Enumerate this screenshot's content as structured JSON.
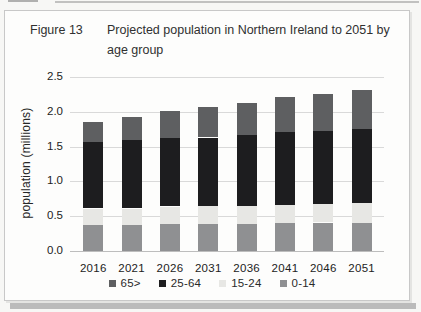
{
  "figure": {
    "label": "Figure 13",
    "title_line1": "Projected population in Northern Ireland to 2051 by",
    "title_line2": "age group"
  },
  "chart_data": {
    "type": "bar",
    "stacked": true,
    "title": "Figure 13  Projected population in Northern Ireland to 2051 by age group",
    "categories": [
      "2016",
      "2021",
      "2026",
      "2031",
      "2036",
      "2041",
      "2046",
      "2051"
    ],
    "series": [
      {
        "name": "0-14",
        "color": "#8f9092",
        "values": [
          0.37,
          0.38,
          0.39,
          0.39,
          0.39,
          0.4,
          0.41,
          0.41
        ]
      },
      {
        "name": "15-24",
        "color": "#e7e7e4",
        "values": [
          0.24,
          0.23,
          0.25,
          0.26,
          0.26,
          0.26,
          0.27,
          0.28
        ]
      },
      {
        "name": "25-64",
        "color": "#1d1d1f",
        "values": [
          0.95,
          0.98,
          0.98,
          0.98,
          1.02,
          1.05,
          1.05,
          1.06
        ]
      },
      {
        "name": "65>",
        "color": "#5e5f61",
        "values": [
          0.29,
          0.34,
          0.39,
          0.44,
          0.45,
          0.5,
          0.52,
          0.56
        ]
      }
    ],
    "totals": [
      1.85,
      1.93,
      2.01,
      2.07,
      2.12,
      2.21,
      2.25,
      2.31
    ],
    "legend_order": [
      "65>",
      "25-64",
      "15-24",
      "0-14"
    ],
    "xlabel": "",
    "ylabel": "population (millions)",
    "ylim": [
      0,
      2.5
    ],
    "yticks": [
      0.0,
      0.5,
      1.0,
      1.5,
      2.0,
      2.5
    ],
    "grid": true,
    "legend_position": "bottom"
  },
  "colors": {
    "gridline": "#d9d9d9",
    "axis_line": "#bdbdbd",
    "text": "#2c2c2c",
    "frame_border": "#c8c8c8"
  }
}
